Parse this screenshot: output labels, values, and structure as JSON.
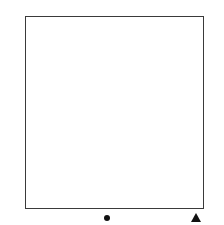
{
  "chart": {
    "columns": 10,
    "rows": 12,
    "symbols": {
      "K": "knit-stitch",
      "P": "purl-stitch"
    },
    "colors": {
      "shade": "#e6e6e6",
      "plain": "#ffffff",
      "ink": "#111111"
    },
    "row_data": [
      {
        "row": 12,
        "label": "12",
        "label_side": "left",
        "shaded": true,
        "cells": [
          "K",
          "K",
          "K",
          "K",
          "K",
          "P",
          "P",
          "P",
          "P",
          "P"
        ]
      },
      {
        "row": 11,
        "label": "11",
        "label_side": "right",
        "shaded": true,
        "cells": [
          "K",
          "K",
          "K",
          "K",
          "K",
          "K",
          "K",
          "K",
          "K",
          "K"
        ]
      },
      {
        "row": 10,
        "label": "10",
        "label_side": "left",
        "shaded": false,
        "cells": [
          "P",
          "P",
          "P",
          "P",
          "P",
          "K",
          "K",
          "K",
          "K",
          "K"
        ]
      },
      {
        "row": 9,
        "label": "9",
        "label_side": "right",
        "shaded": false,
        "cells": [
          "K",
          "K",
          "K",
          "K",
          "K",
          "K",
          "K",
          "K",
          "K",
          "K"
        ]
      },
      {
        "row": 8,
        "label": "8",
        "label_side": "left",
        "shaded": true,
        "cells": [
          "K",
          "K",
          "K",
          "K",
          "K",
          "P",
          "P",
          "P",
          "P",
          "P"
        ]
      },
      {
        "row": 7,
        "label": "7",
        "label_side": "right",
        "shaded": true,
        "cells": [
          "K",
          "K",
          "K",
          "K",
          "K",
          "K",
          "K",
          "K",
          "K",
          "K"
        ]
      },
      {
        "row": 6,
        "label": "6",
        "label_side": "left",
        "shaded": false,
        "cells": [
          "P",
          "P",
          "P",
          "P",
          "P",
          "K",
          "K",
          "K",
          "K",
          "K"
        ]
      },
      {
        "row": 5,
        "label": "5",
        "label_side": "right",
        "shaded": false,
        "cells": [
          "K",
          "K",
          "K",
          "K",
          "K",
          "K",
          "K",
          "K",
          "K",
          "K"
        ]
      },
      {
        "row": 4,
        "label": "4",
        "label_side": "left",
        "shaded": true,
        "cells": [
          "K",
          "K",
          "K",
          "K",
          "K",
          "P",
          "P",
          "P",
          "P",
          "P"
        ]
      },
      {
        "row": 3,
        "label": "3",
        "label_side": "right",
        "shaded": true,
        "cells": [
          "K",
          "K",
          "K",
          "K",
          "K",
          "K",
          "K",
          "K",
          "K",
          "K"
        ]
      },
      {
        "row": 2,
        "label": "2",
        "label_side": "left",
        "shaded": false,
        "cells": [
          "P",
          "P",
          "P",
          "P",
          "P",
          "K",
          "K",
          "K",
          "K",
          "K"
        ]
      },
      {
        "row": 1,
        "label": "1",
        "label_side": "right",
        "shaded": false,
        "cells": [
          "K",
          "K",
          "K",
          "K",
          "K",
          "K",
          "K",
          "K",
          "K",
          "K"
        ]
      }
    ],
    "markers": [
      {
        "type": "dot-marker",
        "column": 5
      },
      {
        "type": "triangle-marker",
        "column": 10
      }
    ]
  }
}
